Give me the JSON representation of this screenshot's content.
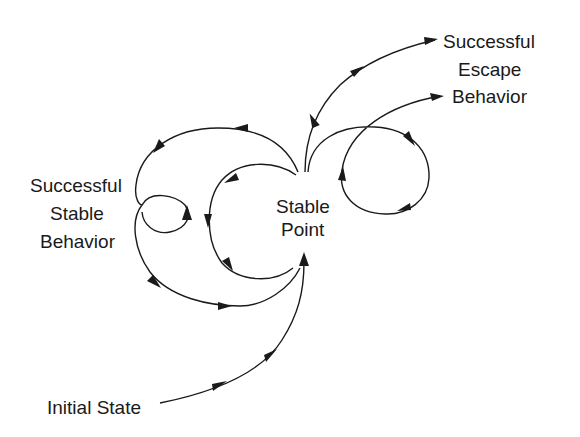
{
  "diagram": {
    "type": "phase-trajectory",
    "labels": {
      "escape": [
        "Successful",
        "Escape",
        "Behavior"
      ],
      "stable_behavior": [
        "Successful",
        "Stable",
        "Behavior"
      ],
      "stable_point": [
        "Stable",
        "Point"
      ],
      "initial_state": "Initial State"
    },
    "trajectories": [
      {
        "name": "initial-to-stable-point",
        "from": "Initial State",
        "to": "Stable Point"
      },
      {
        "name": "outer-stable-loop",
        "from": "Stable Point",
        "to": "Stable Point",
        "via": "Successful Stable Behavior"
      },
      {
        "name": "small-stable-loop",
        "from": "Successful Stable Behavior",
        "to": "Successful Stable Behavior"
      },
      {
        "name": "inner-stable-loop",
        "from": "Stable Point",
        "to": "Stable Point"
      },
      {
        "name": "direct-escape",
        "from": "Stable Point",
        "to": "Successful Escape Behavior"
      },
      {
        "name": "looping-escape",
        "from": "Stable Point",
        "to": "Successful Escape Behavior"
      }
    ],
    "colors": {
      "line": "#1a1a1a",
      "background": "#ffffff"
    }
  }
}
